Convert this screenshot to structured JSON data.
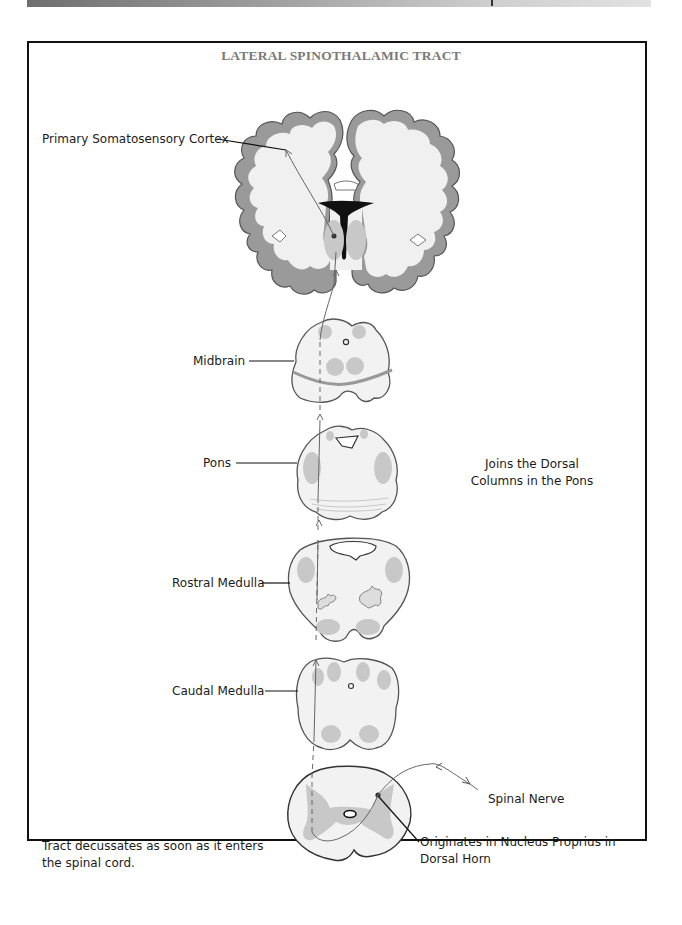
{
  "page": {
    "title": "LATERAL SPINOTHALAMIC TRACT"
  },
  "labels": {
    "cortex": "Primary Somatosensory Cortex",
    "midbrain": "Midbrain",
    "pons": "Pons",
    "rostral_medulla": "Rostral Medulla",
    "caudal_medulla": "Caudal Medulla",
    "spinal_nerve": "Spinal Nerve",
    "origin_line1": "Originates in Nucleus Proprius in",
    "origin_line2": "Dorsal Horn"
  },
  "notes": {
    "pons_note_line1": "Joins the Dorsal",
    "pons_note_line2": "Columns in the Pons",
    "decussation_line1": "Tract decussates as soon as it enters",
    "decussation_line2": "the spinal cord."
  },
  "colors": {
    "frame": "#111111",
    "title": "#7a7a7a",
    "cortex_gray": "#8a8a8a",
    "white_matter": "#f2f2f2",
    "nuclei": "#c8c8c8",
    "tract_line": "#666666"
  }
}
